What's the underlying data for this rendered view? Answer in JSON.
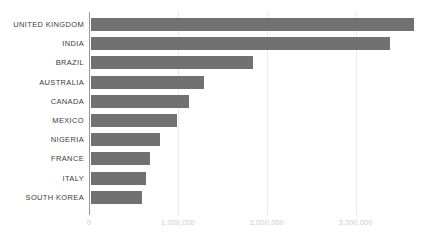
{
  "chart_data": {
    "type": "bar",
    "orientation": "horizontal",
    "title": "",
    "xlabel": "",
    "ylabel": "",
    "categories": [
      "UNITED KINGDOM",
      "INDIA",
      "BRAZIL",
      "AUSTRALIA",
      "CANADA",
      "MEXICO",
      "NIGERIA",
      "FRANCE",
      "ITALY",
      "SOUTH KOREA"
    ],
    "values": [
      3630000,
      3360000,
      1820000,
      1270000,
      1100000,
      970000,
      775000,
      665000,
      620000,
      575000
    ],
    "xlim": [
      0,
      3900000
    ],
    "xticks": [
      0,
      1000000,
      2000000,
      3000000
    ],
    "xtick_labels": [
      "0",
      "1,000,000",
      "2,000,000",
      "3,000,000"
    ],
    "grid": true,
    "legend": false,
    "bar_color": "#717171",
    "gridline_color": "#eaeaea",
    "axis_color": "#9a9a9a",
    "label_color": "#3b3b3b",
    "tick_label_color": "#c9c9c9"
  }
}
